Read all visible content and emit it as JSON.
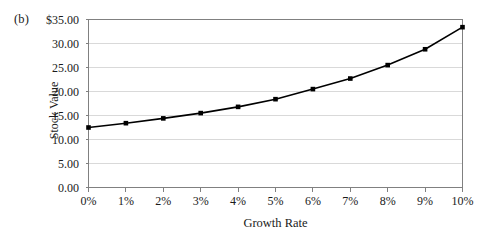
{
  "panel": {
    "label": "(b)"
  },
  "chart_data": {
    "type": "line",
    "title": "",
    "panel_label": "(b)",
    "xlabel": "Growth Rate",
    "ylabel": "Stock Value",
    "x": [
      0,
      1,
      2,
      3,
      4,
      5,
      6,
      7,
      8,
      9,
      10
    ],
    "categories": [
      "0%",
      "1%",
      "2%",
      "3%",
      "4%",
      "5%",
      "6%",
      "7%",
      "8%",
      "9%",
      "10%"
    ],
    "values": [
      12.5,
      13.4,
      14.4,
      15.5,
      16.8,
      18.4,
      20.5,
      22.7,
      25.5,
      28.8,
      33.4
    ],
    "xtick_labels": [
      "0%",
      "1%",
      "2%",
      "3%",
      "4%",
      "5%",
      "6%",
      "7%",
      "8%",
      "9%",
      "10%"
    ],
    "ytick_labels": [
      "$35.00",
      "30.00",
      "25.00",
      "20.00",
      "15.00",
      "10.00",
      "5.00",
      "0.00"
    ],
    "ytick_values": [
      35,
      30,
      25,
      20,
      15,
      10,
      5,
      0
    ],
    "ylim": [
      0,
      35
    ],
    "xlim": [
      0,
      10
    ],
    "grid": "horizontal",
    "legend": "none",
    "marker": "square",
    "series_color": "#000000",
    "grid_color": "#d9d9d9",
    "axis_color": "#808080"
  }
}
